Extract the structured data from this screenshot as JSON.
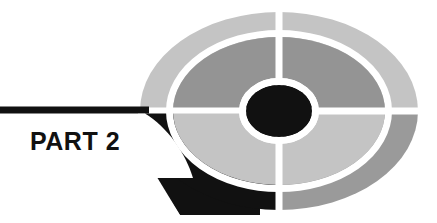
{
  "page": {
    "kind": "book-part-divider",
    "title_text": "PART 2",
    "part_word": "PART",
    "part_number": "2",
    "background_color": "#ffffff"
  },
  "banner": {
    "name": "part-banner",
    "fill_color": "#111111",
    "label": "PART 2",
    "label_color": "#ffffff"
  },
  "logo": {
    "name": "concentric-target-ellipse",
    "center_x": 279,
    "center_y": 111,
    "outer_rx": 139,
    "outer_ry": 99,
    "mid_rx": 106,
    "mid_ry": 74,
    "inner_rx": 71,
    "inner_ry": 50,
    "core_rx": 33,
    "core_ry": 26,
    "divider_color": "#ffffff",
    "divider_width": 7,
    "quadrants": [
      {
        "name": "outer-ring-top-left",
        "ring": "outer",
        "position": "top-left",
        "color": "#c4c4c4"
      },
      {
        "name": "outer-ring-top-right",
        "ring": "outer",
        "position": "top-right",
        "color": "#c4c4c4"
      },
      {
        "name": "outer-ring-bottom-right",
        "ring": "outer",
        "position": "bottom-right",
        "color": "#9a9a9a"
      },
      {
        "name": "outer-ring-bottom-left",
        "ring": "outer",
        "position": "bottom-left",
        "color": "#111111"
      },
      {
        "name": "middle-ring-top-left",
        "ring": "middle",
        "position": "top-left",
        "color": "#949494"
      },
      {
        "name": "middle-ring-top-right",
        "ring": "middle",
        "position": "top-right",
        "color": "#949494"
      },
      {
        "name": "middle-ring-bottom-right",
        "ring": "middle",
        "position": "bottom-right",
        "color": "#c4c4c4"
      },
      {
        "name": "middle-ring-bottom-left",
        "ring": "middle",
        "position": "bottom-left",
        "color": "#c4c4c4"
      },
      {
        "name": "core-ellipse",
        "ring": "core",
        "position": "center",
        "color": "#111111"
      }
    ]
  }
}
